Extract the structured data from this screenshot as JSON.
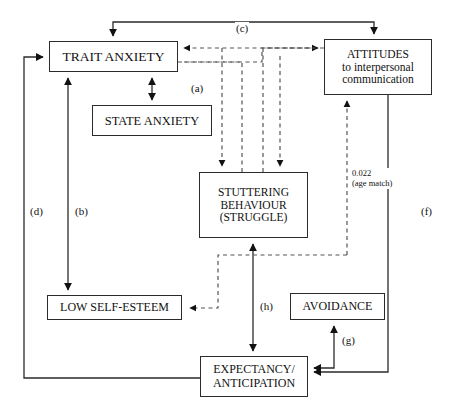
{
  "diagram": {
    "background_color": "#ffffff",
    "stroke_color": "#2b2b2b",
    "nodes": [
      {
        "id": "trait-anxiety",
        "lines": [
          "TRAIT ANXIETY"
        ]
      },
      {
        "id": "state-anxiety",
        "lines": [
          "STATE ANXIETY"
        ]
      },
      {
        "id": "attitudes",
        "lines": [
          "ATTITUDES",
          "to interpersonal",
          "communication"
        ]
      },
      {
        "id": "stuttering",
        "lines": [
          "STUTTERING",
          "BEHAVIOUR",
          "(STRUGGLE)"
        ]
      },
      {
        "id": "low-self-esteem",
        "lines": [
          "LOW SELF-ESTEEM"
        ]
      },
      {
        "id": "avoidance",
        "lines": [
          "AVOIDANCE"
        ]
      },
      {
        "id": "expectancy",
        "lines": [
          "EXPECTANCY/",
          "ANTICIPATION"
        ]
      }
    ],
    "edge_labels": {
      "a": "(a)",
      "b": "(b)",
      "c": "(c)",
      "d": "(d)",
      "f": "(f)",
      "g": "(g)",
      "h": "(h)"
    },
    "annotations": {
      "stat_value": "0.022",
      "stat_note": "(age match)"
    }
  }
}
